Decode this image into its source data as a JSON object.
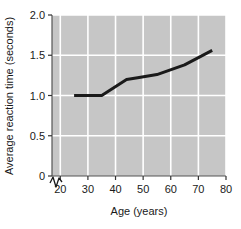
{
  "chart_data": {
    "type": "line",
    "title": "",
    "xlabel": "Age (years)",
    "ylabel": "Average reaction time (seconds)",
    "xlim": [
      17,
      80
    ],
    "ylim": [
      0,
      2.0
    ],
    "xticks": [
      "20",
      "30",
      "40",
      "50",
      "60",
      "70",
      "80"
    ],
    "xtick_values": [
      20,
      30,
      40,
      50,
      60,
      70,
      80
    ],
    "yticks": [
      "0",
      "0.5",
      "1.0",
      "1.5",
      "2.0"
    ],
    "ytick_values": [
      0,
      0.5,
      1.0,
      1.5,
      2.0
    ],
    "grid": true,
    "legend": "none",
    "axis_break": true,
    "axis_break_symbol": "zigzag-at-origin",
    "plot_background_color": "#c6c6c6",
    "gridline_color": "#ffffff",
    "line_color": "#1a1a1a",
    "line_width": 3,
    "x": [
      25,
      35,
      44,
      48,
      55,
      65,
      75
    ],
    "values": [
      1.0,
      1.0,
      1.2,
      1.22,
      1.26,
      1.38,
      1.56
    ],
    "series": [
      {
        "name": "Average reaction time",
        "points": [
          {
            "age": 25,
            "reaction_time": 1.0
          },
          {
            "age": 35,
            "reaction_time": 1.0
          },
          {
            "age": 44,
            "reaction_time": 1.2
          },
          {
            "age": 48,
            "reaction_time": 1.22
          },
          {
            "age": 55,
            "reaction_time": 1.26
          },
          {
            "age": 65,
            "reaction_time": 1.38
          },
          {
            "age": 75,
            "reaction_time": 1.56
          }
        ]
      }
    ]
  }
}
